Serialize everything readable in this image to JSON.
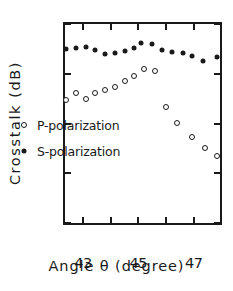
{
  "chart_data": {
    "type": "scatter",
    "title": "",
    "xlabel": "Angle θ (degree)",
    "ylabel": "Crosstalk (dB)",
    "xlim": [
      42.35,
      47.95
    ],
    "ylim": [
      -40,
      0
    ],
    "y_inverted": true,
    "grid": false,
    "legend_position": "inside-left-center",
    "xticks": [
      43,
      44,
      45,
      46,
      47
    ],
    "xtick_labels": [
      "43",
      "",
      "45",
      "",
      "47"
    ],
    "yticks": [
      -40,
      -30,
      -20,
      -10,
      0
    ],
    "ytick_labels": [
      "-40",
      "-30",
      "-20",
      "-10",
      "0"
    ],
    "series": [
      {
        "name": "P-polarization",
        "marker": "open-circle",
        "color": "#1a1a1a",
        "points": [
          {
            "x": 42.4,
            "y": -24.8
          },
          {
            "x": 42.75,
            "y": -26.2
          },
          {
            "x": 43.1,
            "y": -25.0
          },
          {
            "x": 43.45,
            "y": -26.1
          },
          {
            "x": 43.8,
            "y": -26.7
          },
          {
            "x": 44.15,
            "y": -27.4
          },
          {
            "x": 44.5,
            "y": -28.6
          },
          {
            "x": 44.85,
            "y": -29.6
          },
          {
            "x": 45.2,
            "y": -30.9
          },
          {
            "x": 45.6,
            "y": -30.6
          },
          {
            "x": 46.0,
            "y": -23.4
          },
          {
            "x": 46.4,
            "y": -20.1
          },
          {
            "x": 46.95,
            "y": -17.2
          },
          {
            "x": 47.4,
            "y": -15.1
          },
          {
            "x": 47.85,
            "y": -13.4
          }
        ]
      },
      {
        "name": "S-polarization",
        "marker": "filled-circle",
        "color": "#1a1a1a",
        "points": [
          {
            "x": 42.4,
            "y": -34.9
          },
          {
            "x": 42.75,
            "y": -35.2
          },
          {
            "x": 43.1,
            "y": -35.3
          },
          {
            "x": 43.45,
            "y": -34.7
          },
          {
            "x": 43.8,
            "y": -34.0
          },
          {
            "x": 44.15,
            "y": -34.1
          },
          {
            "x": 44.5,
            "y": -34.6
          },
          {
            "x": 44.85,
            "y": -35.1
          },
          {
            "x": 45.1,
            "y": -36.1
          },
          {
            "x": 45.5,
            "y": -36.0
          },
          {
            "x": 45.85,
            "y": -34.7
          },
          {
            "x": 46.2,
            "y": -34.4
          },
          {
            "x": 46.6,
            "y": -34.2
          },
          {
            "x": 46.95,
            "y": -33.5
          },
          {
            "x": 47.35,
            "y": -32.6
          },
          {
            "x": 47.85,
            "y": -33.3
          }
        ]
      }
    ],
    "legend": [
      {
        "label": "P-polarization",
        "marker": "open-circle"
      },
      {
        "label": "S-polarization",
        "marker": "filled-circle"
      }
    ]
  }
}
